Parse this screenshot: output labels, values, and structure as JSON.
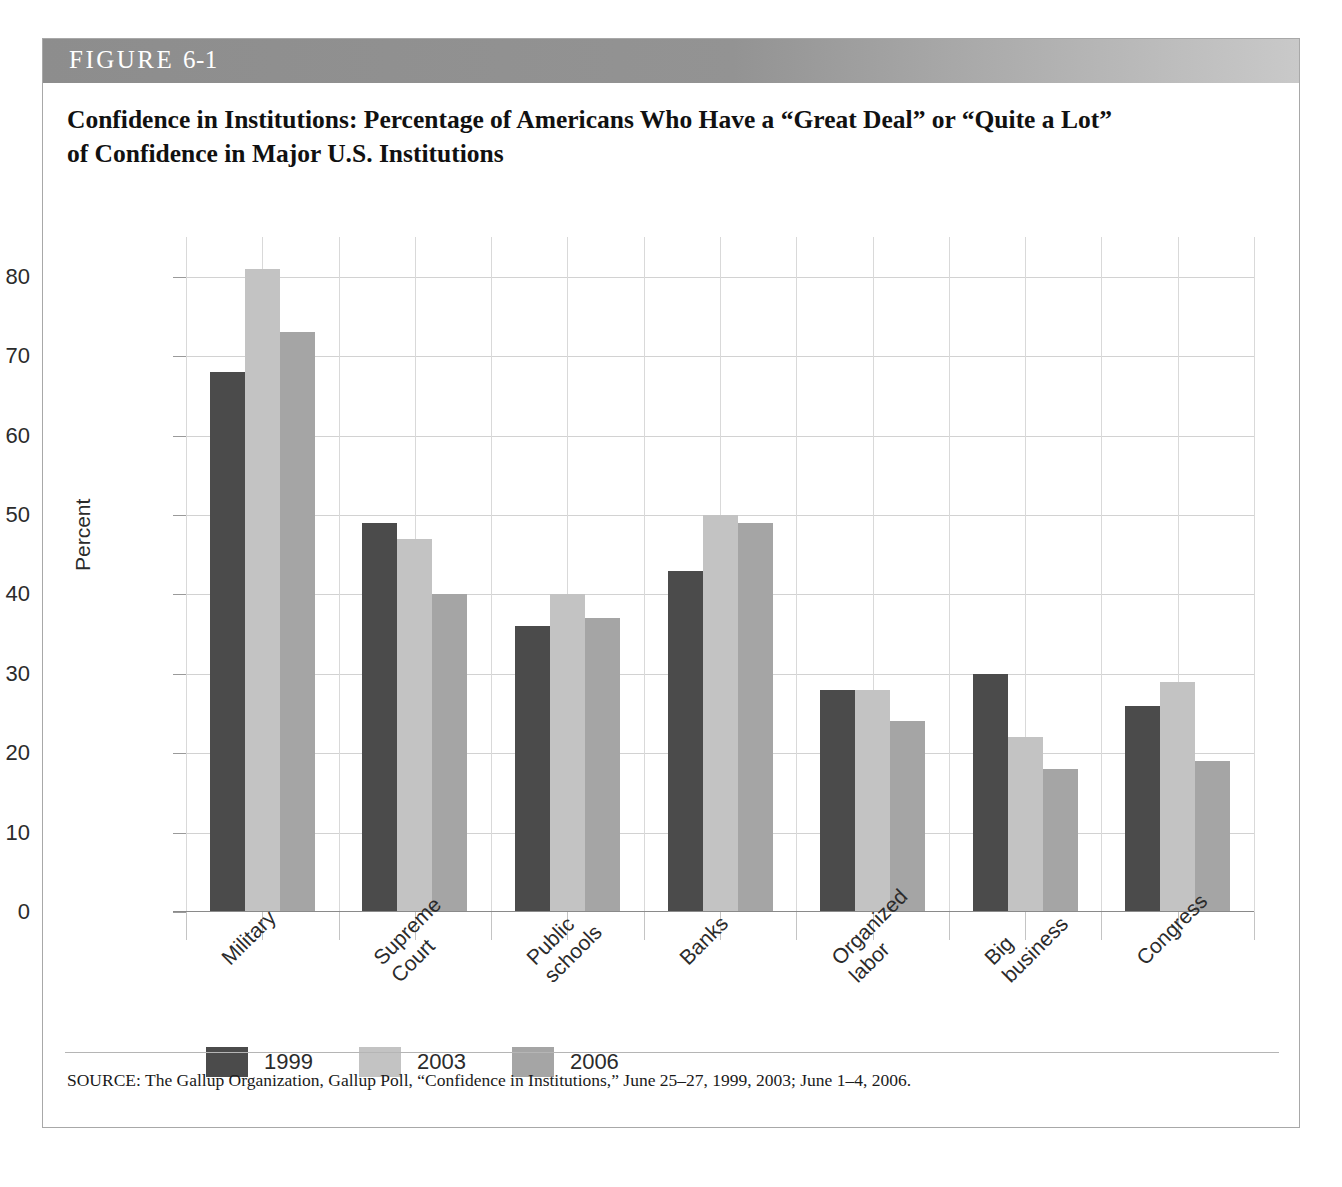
{
  "figure": {
    "header_label": "FIGURE",
    "header_number": "6-1",
    "title_line1": "Confidence in Institutions: Percentage of Americans Who Have a “Great Deal” or “Quite a Lot”",
    "title_line2": "of Confidence in Major U.S. Institutions",
    "source_note": "SOURCE: The Gallup Organization, Gallup Poll, “Confidence in Institutions,” June 25–27, 1999, 2003; June 1–4, 2006."
  },
  "colors": {
    "series_1999": "#4b4b4b",
    "series_2003": "#c3c3c3",
    "series_2006": "#a5a5a5",
    "header_band": "#8d8d8d",
    "grid": "#d2d2d2",
    "frame": "#a8a8a8"
  },
  "chart_data": {
    "type": "bar",
    "title": "Confidence in Institutions: Percentage of Americans Who Have a “Great Deal” or “Quite a Lot” of Confidence in Major U.S. Institutions",
    "xlabel": "",
    "ylabel": "Percent",
    "ylim": [
      0,
      85
    ],
    "yticks": [
      0,
      10,
      20,
      30,
      40,
      50,
      60,
      70,
      80
    ],
    "ytick_labels": [
      "0",
      "10",
      "20",
      "30",
      "40",
      "50",
      "60",
      "70",
      "80"
    ],
    "grid": true,
    "legend_position": "bottom-left",
    "categories": [
      "Military",
      "Supreme Court",
      "Public schools",
      "Banks",
      "Organized labor",
      "Big business",
      "Congress"
    ],
    "category_label_lines": [
      [
        "Military"
      ],
      [
        "Supreme",
        "Court"
      ],
      [
        "Public",
        "schools"
      ],
      [
        "Banks"
      ],
      [
        "Organized",
        "labor"
      ],
      [
        "Big",
        "business"
      ],
      [
        "Congress"
      ]
    ],
    "series": [
      {
        "name": "1999",
        "color": "#4b4b4b",
        "values": [
          68,
          49,
          36,
          43,
          28,
          30,
          26
        ]
      },
      {
        "name": "2003",
        "color": "#c3c3c3",
        "values": [
          81,
          47,
          40,
          50,
          28,
          22,
          29
        ]
      },
      {
        "name": "2006",
        "color": "#a5a5a5",
        "values": [
          73,
          40,
          37,
          49,
          24,
          18,
          19
        ]
      }
    ]
  }
}
